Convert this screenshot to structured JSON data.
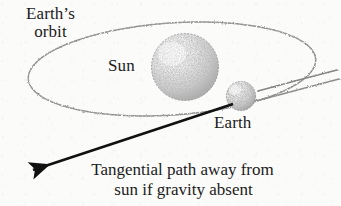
{
  "figure": {
    "kind": "astronomy-diagram",
    "background_color": "#fbfbfa",
    "ink_color": "#1b1b1b",
    "sketch_color": "#7b7b7b"
  },
  "labels": {
    "orbit_line1": "Earth’s",
    "orbit_line2": "orbit",
    "sun": "Sun",
    "earth": "Earth"
  },
  "caption": {
    "line1": "Tangential path away from",
    "line2": "sun if gravity absent"
  },
  "bodies": [
    {
      "name": "sun",
      "label": "Sun",
      "cx": 185,
      "cy": 67,
      "r": 34,
      "style": "stippled-sphere",
      "highlight": "upper-left"
    },
    {
      "name": "earth",
      "label": "Earth",
      "cx": 241,
      "cy": 96,
      "r": 15,
      "style": "stippled-sphere",
      "highlight": "upper-left"
    }
  ],
  "orbit": {
    "name": "earth-orbit-ellipse",
    "cx": 172,
    "cy": 69,
    "rx": 144,
    "ry": 46,
    "rotation_deg": -4,
    "stroke": "#8a8a8a",
    "style": "hand-drawn-dashed"
  },
  "trail_lines": [
    {
      "name": "orbit-trail-upper",
      "from_x": 258,
      "from_y": 92,
      "to_x": 336,
      "to_y": 72
    },
    {
      "name": "orbit-trail-lower",
      "from_x": 256,
      "from_y": 101,
      "to_x": 338,
      "to_y": 80
    }
  ],
  "arrow": {
    "name": "tangential-path-arrow",
    "from_x": 233,
    "from_y": 104,
    "to_x": 27,
    "to_y": 172,
    "stroke": "#111111",
    "stroke_width": 2.6,
    "head": "solid-triangle"
  }
}
